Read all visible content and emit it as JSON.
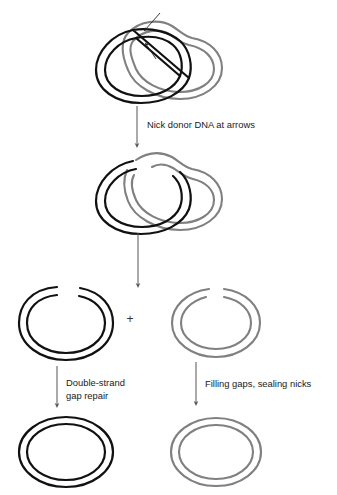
{
  "figure": {
    "background_color": "#ffffff",
    "colors": {
      "recipient_strand": "#111111",
      "donor_strand": "#808080",
      "arrow": "#555555",
      "text": "#1a1a1a",
      "pointer_arrow": "#222222"
    },
    "stroke_widths": {
      "black_dna": 2.1,
      "gray_dna": 2.1,
      "process_arrow": 1.0,
      "pointer_arrow": 0.9
    }
  },
  "steps": [
    {
      "id": "step-1-joint-molecule",
      "name": "joint-molecule-with-d-loop",
      "description": "Black circular duplex interlocked with gray donor duplex forming a D-loop bubble",
      "pointer_arrow_count": 2
    },
    {
      "id": "step-2-nicked-joint",
      "name": "nicked-joint-molecule",
      "description": "Same joint molecule after nicking, with gaps in both black and gray strands"
    },
    {
      "id": "step-3-separated",
      "name": "separated-products",
      "description": "Black gapped circle plus gray nicked circle"
    },
    {
      "id": "step-4-products",
      "name": "repaired-products",
      "description": "Closed black circle and closed gray circle"
    }
  ],
  "labels": {
    "nick_donor": "Nick donor DNA at arrows",
    "double_strand": "Double-strand",
    "gap_repair": "gap repair",
    "filling_sealing": "Filling gaps, sealing nicks",
    "plus_sign": "+"
  },
  "arrows": {
    "nick_step": {
      "name": "arrow-nick-donor",
      "x": 137,
      "y1": 106,
      "y2": 146
    },
    "separate_step": {
      "name": "arrow-separate",
      "x": 138,
      "y1": 233,
      "y2": 286
    },
    "left_repair": {
      "name": "arrow-double-strand-gap-repair",
      "x": 57,
      "y1": 366,
      "y2": 406
    },
    "right_repair": {
      "name": "arrow-filling-sealing",
      "x": 196,
      "y1": 362,
      "y2": 404
    }
  },
  "structures": {
    "top_joint": {
      "cx": 160,
      "cy": 55
    },
    "nicked_joint": {
      "cx": 160,
      "cy": 186
    },
    "black_gapped_circle": {
      "cx": 66,
      "cy": 323,
      "rx": 46,
      "ry": 36
    },
    "gray_nicked_circle": {
      "cx": 216,
      "cy": 323,
      "rx": 45,
      "ry": 34
    },
    "black_closed_circle": {
      "cx": 66,
      "cy": 452,
      "rx": 46,
      "ry": 35
    },
    "gray_closed_circle": {
      "cx": 216,
      "cy": 452,
      "rx": 44,
      "ry": 34
    }
  }
}
